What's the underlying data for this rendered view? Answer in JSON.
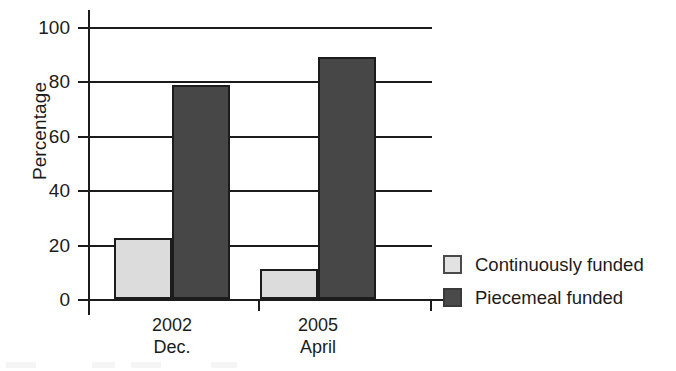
{
  "chart_data": {
    "type": "bar",
    "title": "",
    "subtitle": "",
    "xlabel": "",
    "ylabel": "Percentage",
    "ylim": [
      0,
      100
    ],
    "yticks": [
      0,
      20,
      40,
      60,
      80,
      100
    ],
    "ytick_labels": [
      "0",
      "20",
      "40",
      "60",
      "80",
      "100"
    ],
    "grid": "horizontal",
    "legend_position": "right",
    "categories": [
      "2002 Dec.",
      "2005 April"
    ],
    "category_lines": [
      [
        "2002",
        "Dec."
      ],
      [
        "2005",
        "April"
      ]
    ],
    "series": [
      {
        "name": "Continuously funded",
        "color": "#dcdcdc",
        "values": [
          22.5,
          11
        ]
      },
      {
        "name": "Piecemeal funded",
        "color": "#474747",
        "values": [
          78.5,
          89
        ]
      }
    ]
  },
  "legend": {
    "items": [
      {
        "label": "Continuously funded",
        "swatch": "light"
      },
      {
        "label": "Piecemeal funded",
        "swatch": "dark"
      }
    ]
  },
  "colors": {
    "axis": "#1c1c1c",
    "gridline": "#1c1c1c",
    "series_light": "#dcdcdc",
    "series_dark": "#474747",
    "background": "#ffffff"
  }
}
